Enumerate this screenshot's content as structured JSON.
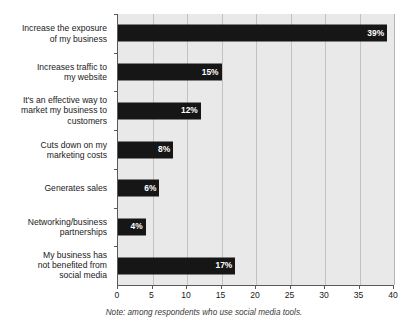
{
  "chart_data": {
    "type": "bar",
    "orientation": "horizontal",
    "title": "",
    "xlabel": "",
    "ylabel": "",
    "xlim": [
      0,
      40
    ],
    "xticks": [
      0,
      5,
      10,
      15,
      20,
      25,
      30,
      35,
      40
    ],
    "grid": true,
    "legend": false,
    "categories": [
      "Increase the exposure of my business",
      "Increases traffic to my website",
      "It's an effective way to market my business to customers",
      "Cuts down on my marketing costs",
      "Generates sales",
      "Networking/business partnerships",
      "My business has not benefited from social media"
    ],
    "values": [
      39,
      15,
      12,
      8,
      6,
      4,
      17
    ],
    "value_labels": [
      "39%",
      "15%",
      "12%",
      "8%",
      "6%",
      "4%",
      "17%"
    ],
    "annotation": "Note: among respondents who use social media tools.",
    "colors": {
      "bar": "#161616",
      "plot_background": "#e9e9e9",
      "gridline": "#c2c2c2",
      "axis": "#5a5a5a",
      "value_label": "#ffffff",
      "text": "#1a1a1a"
    }
  },
  "category_lines": [
    [
      "Increase the exposure",
      "of my business"
    ],
    [
      "Increases traffic to",
      "my website"
    ],
    [
      "It's an effective way to",
      "market my business to",
      "customers"
    ],
    [
      "Cuts down on my",
      "marketing costs"
    ],
    [
      "Generates sales"
    ],
    [
      "Networking/business",
      "partnerships"
    ],
    [
      "My business has",
      "not benefited from",
      "social media"
    ]
  ],
  "footnote": "Note: among respondents who use social media tools."
}
